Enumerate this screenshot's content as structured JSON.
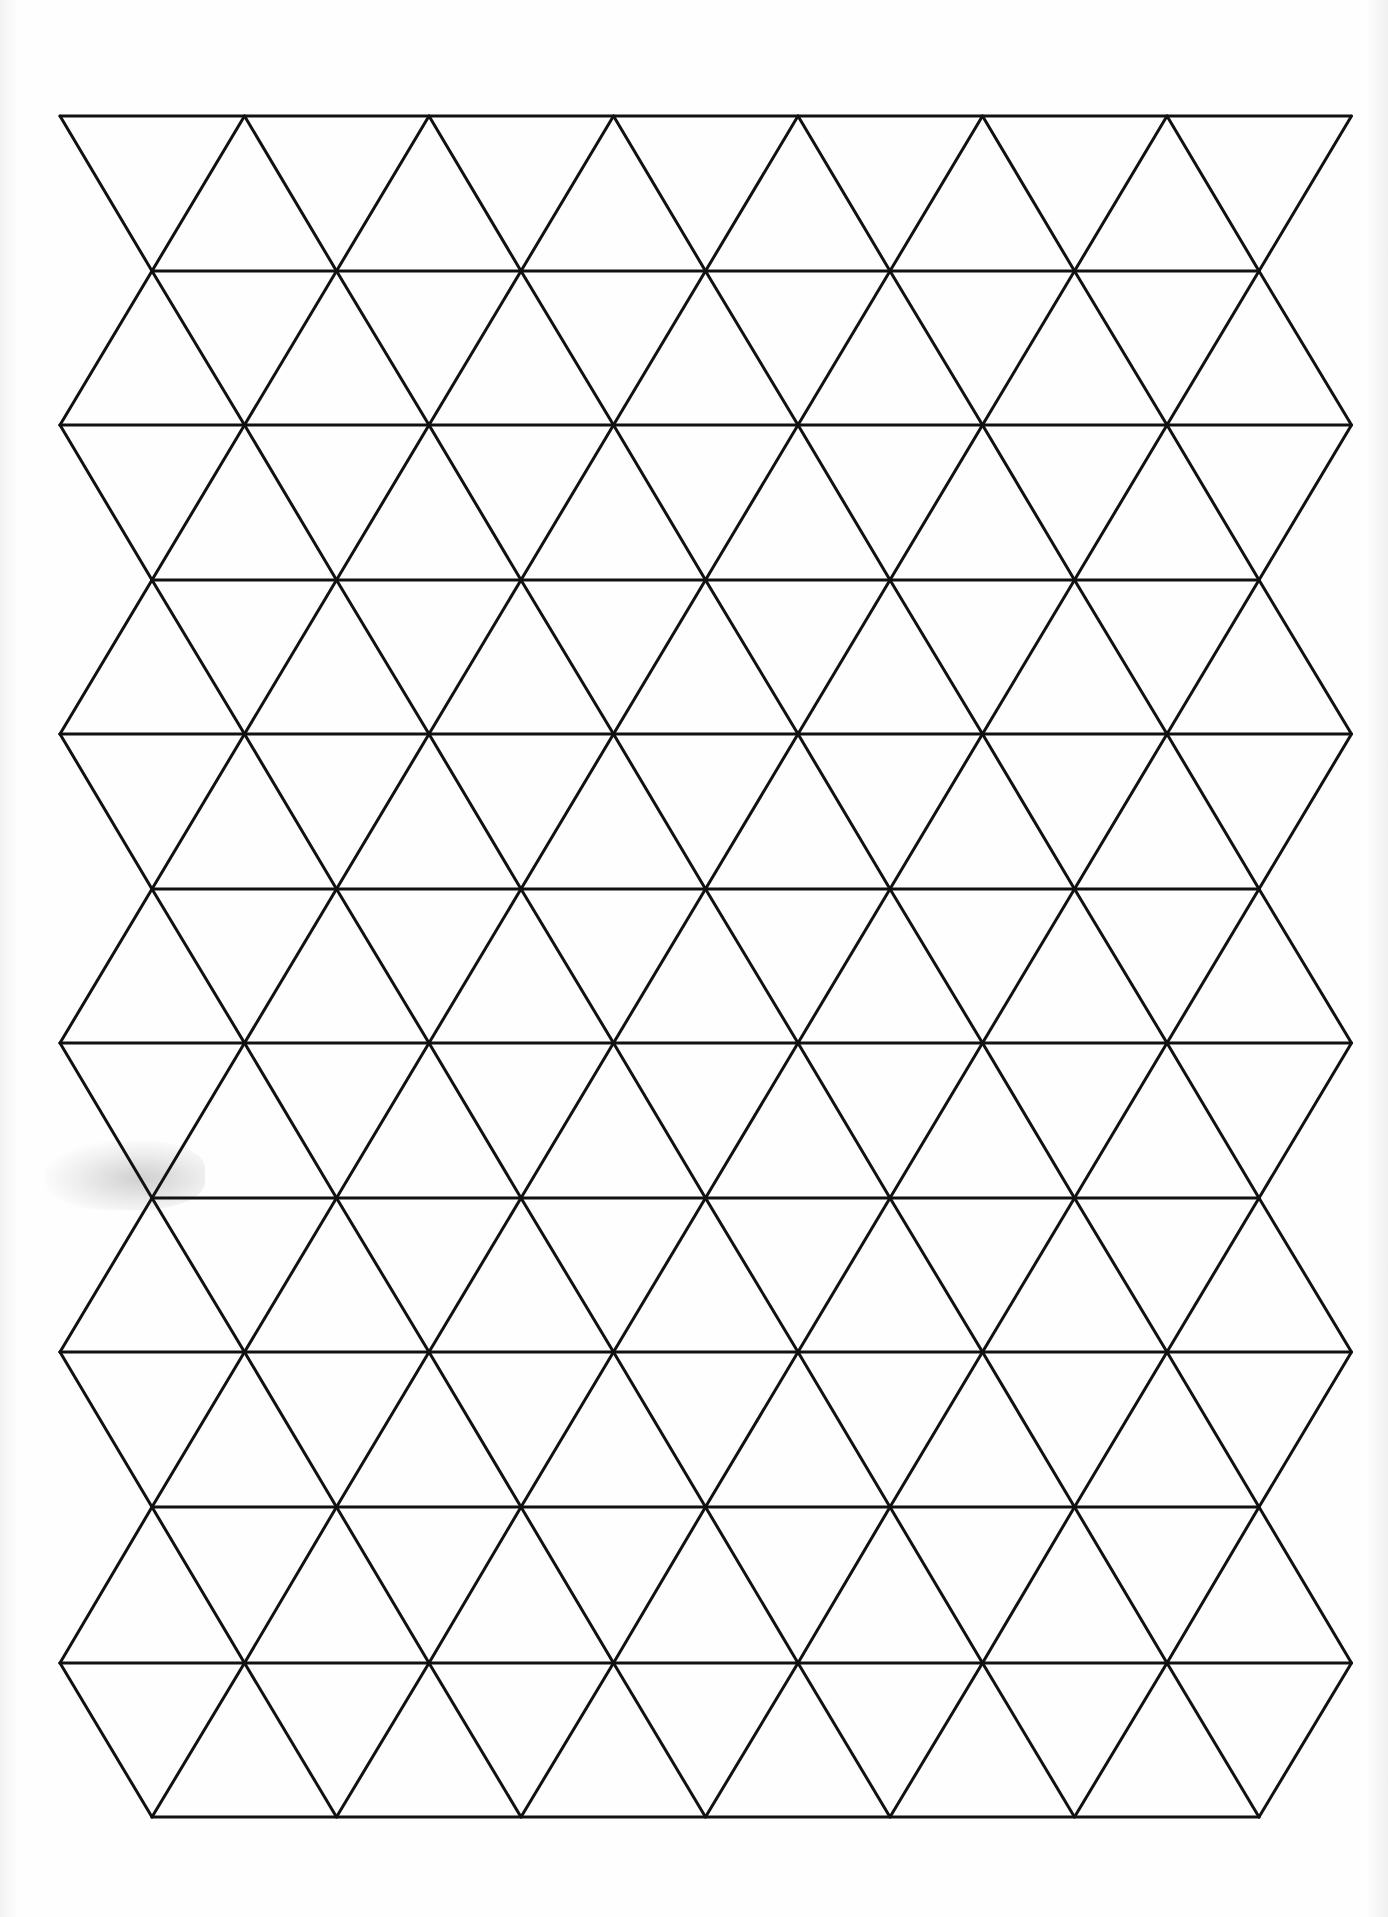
{
  "page": {
    "type": "triangle grid paper (scanned)",
    "background": "#fefefe",
    "line_color": "#111111",
    "line_width": 3
  },
  "grid": {
    "columns": 7,
    "rows": 11,
    "triangle_side_px": 184.5,
    "row_height_px": 154.6,
    "origin": {
      "x": 60,
      "y": 116
    },
    "wide_row_span": {
      "x_start": 60,
      "x_end": 1351
    },
    "narrow_row_span": {
      "x_start": 152,
      "x_end": 1259
    },
    "horizontal_lines_y": [
      116,
      271,
      425,
      580,
      734,
      889,
      1043,
      1198,
      1352,
      1507,
      1663,
      1817
    ]
  },
  "artifacts": [
    {
      "kind": "scan-smudge",
      "x": 50,
      "y": 1145,
      "width": 150,
      "height": 60
    }
  ]
}
